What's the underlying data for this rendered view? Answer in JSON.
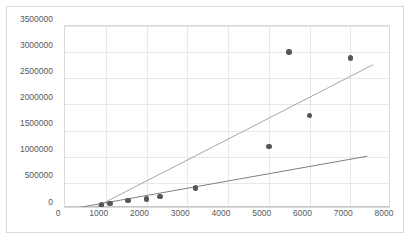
{
  "chart_data": {
    "type": "scatter",
    "title": "",
    "subtitle": "",
    "xlabel": "",
    "ylabel": "",
    "xlim": [
      0,
      8000
    ],
    "ylim": [
      0,
      3500000
    ],
    "grid": true,
    "legend": "none",
    "x_ticks": [
      0,
      1000,
      2000,
      3000,
      4000,
      5000,
      6000,
      7000,
      8000
    ],
    "x_tick_labels": [
      "0",
      "1000",
      "2000",
      "3000",
      "4000",
      "5000",
      "6000",
      "7000",
      "8000"
    ],
    "y_ticks": [
      0,
      500000,
      1000000,
      1500000,
      2000000,
      2500000,
      3000000,
      3500000
    ],
    "y_tick_labels": [
      "0",
      "500000",
      "1000000",
      "1500000",
      "2000000",
      "2500000",
      "3000000",
      "3500000"
    ],
    "series": [
      {
        "name": "data-points",
        "type": "scatter",
        "marker_color": "#565656",
        "points": [
          {
            "x": 900,
            "y": 80000
          },
          {
            "x": 1100,
            "y": 105000
          },
          {
            "x": 1550,
            "y": 160000
          },
          {
            "x": 2000,
            "y": 195000
          },
          {
            "x": 2330,
            "y": 240000
          },
          {
            "x": 3200,
            "y": 400000
          },
          {
            "x": 5000,
            "y": 1200000
          },
          {
            "x": 5500,
            "y": 3000000
          },
          {
            "x": 6000,
            "y": 1790000
          },
          {
            "x": 7000,
            "y": 2890000
          }
        ]
      },
      {
        "name": "steep-trendline",
        "type": "line",
        "color": "#a6a6a6",
        "x_start": 560,
        "y_start": -40000,
        "x_end": 7560,
        "y_end": 2760000
      },
      {
        "name": "shallow-trendline",
        "type": "line",
        "color": "#7f7f7f",
        "x_start": 140,
        "y_start": 0,
        "x_end": 7420,
        "y_end": 1010000
      }
    ]
  },
  "axes": {
    "y_axis_name": "value-axis",
    "x_axis_name": "category-axis"
  }
}
